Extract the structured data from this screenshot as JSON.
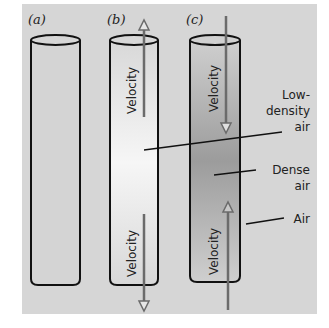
{
  "figure": {
    "background_color": "#d6d6d6",
    "panels": [
      {
        "id": "a",
        "label": "(a)",
        "fill": "uniform",
        "arrows": []
      },
      {
        "id": "b",
        "label": "(b)",
        "fill": "light-center",
        "arrows": [
          {
            "label": "Velocity",
            "position": "top",
            "direction": "up"
          },
          {
            "label": "Velocity",
            "position": "bottom",
            "direction": "down"
          }
        ]
      },
      {
        "id": "c",
        "label": "(c)",
        "fill": "dark-center",
        "arrows": [
          {
            "label": "Velocity",
            "position": "top",
            "direction": "down"
          },
          {
            "label": "Velocity",
            "position": "bottom",
            "direction": "up"
          }
        ]
      }
    ],
    "callouts": {
      "low_density_line1": "Low-",
      "low_density_line2": "density",
      "low_density_line3": "air",
      "dense_line1": "Dense",
      "dense_line2": "air",
      "air": "Air"
    },
    "colors": {
      "outline": "#111111",
      "arrow": "#6b6b6b",
      "light_center": "#f4f4f4",
      "dark_center": "#9a9a9a"
    }
  }
}
